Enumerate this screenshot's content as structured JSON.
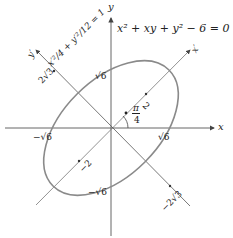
{
  "figure": {
    "equation": "x² + xy + y² − 6 = 0",
    "rotated_equation": "x′²/4 + y′²/12 = 1",
    "axes": {
      "x": "x",
      "y": "y",
      "x_prime": "x′",
      "y_prime": "y′"
    },
    "angle_label_num": "π",
    "angle_label_den": "4",
    "ticks": {
      "x_pos": "√6",
      "x_neg": "−√6",
      "y_pos": "√6",
      "y_neg": "−√6",
      "xp_pos": "2",
      "xp_neg": "−2",
      "yp_pos": "2√3",
      "yp_neg": "−2√3"
    },
    "colors": {
      "ellipse": "#8a8a8a",
      "axes": "#555555",
      "text": "#222222"
    }
  }
}
